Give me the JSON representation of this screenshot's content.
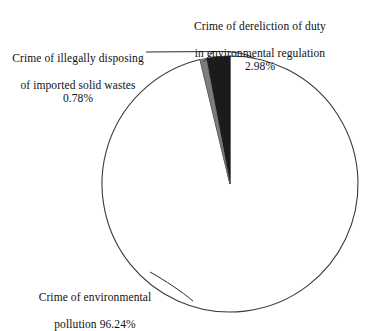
{
  "chart_data": {
    "type": "pie",
    "title": "",
    "categories": [
      "Crime of environmental pollution",
      "Crime of dereliction of duty in environmental regulation",
      "Crime of illegally disposing of imported solid wastes"
    ],
    "values": [
      96.24,
      2.98,
      0.78
    ],
    "value_labels": [
      "96.24%",
      "2.98%",
      "0.78%"
    ],
    "unit": "%",
    "colors": [
      "#ffffff",
      "#1b1b1b",
      "#7d7d7d"
    ],
    "stroke_color": "#3a3a3a",
    "legend": "none",
    "labels_position": "outside-with-leader-lines",
    "start_angle_deg": 0,
    "direction": "clockwise"
  },
  "labels": {
    "dereliction": {
      "line1": "Crime of dereliction of duty",
      "line2": "in environmental regulation",
      "value": "2.98%"
    },
    "illegal": {
      "line1": "Crime of illegally disposing",
      "line2": "of imported solid wastes",
      "value": "0.78%"
    },
    "pollution": {
      "line1": "Crime of environmental",
      "line2": "pollution 96.24%"
    }
  },
  "geometry": {
    "center_x": 230,
    "center_y": 184,
    "radius": 128
  }
}
